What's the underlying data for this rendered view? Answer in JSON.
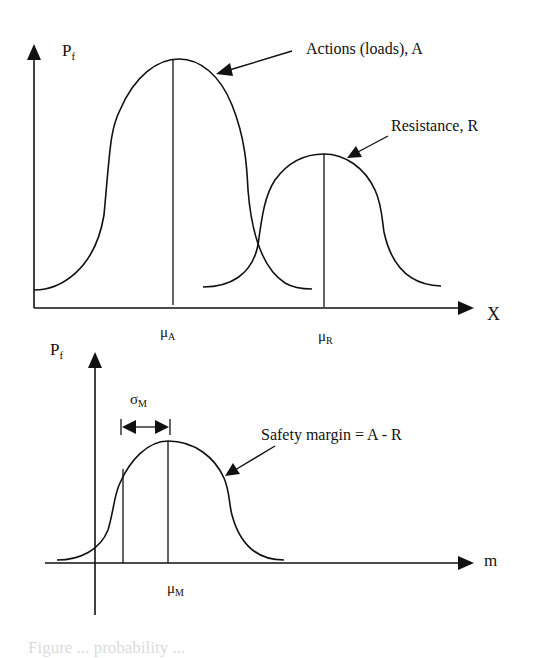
{
  "top_chart": {
    "y_axis_label": "P",
    "y_axis_label_sub": "f",
    "x_axis_label": "X",
    "curves": [
      {
        "name": "actions",
        "annotation": "Actions (loads), A",
        "mean_label": "μ",
        "mean_sub": "A"
      },
      {
        "name": "resistance",
        "annotation": "Resistance, R",
        "mean_label": "μ",
        "mean_sub": "R"
      }
    ]
  },
  "bottom_chart": {
    "y_axis_label": "P",
    "y_axis_label_sub": "f",
    "x_axis_label": "m",
    "sigma_label": "σ",
    "sigma_sub": "M",
    "annotation": "Safety margin = A - R",
    "mean_label": "μ",
    "mean_sub": "M"
  },
  "caption": "Figure ... probability ...",
  "colors": {
    "line": "#111111",
    "background": "#ffffff"
  }
}
